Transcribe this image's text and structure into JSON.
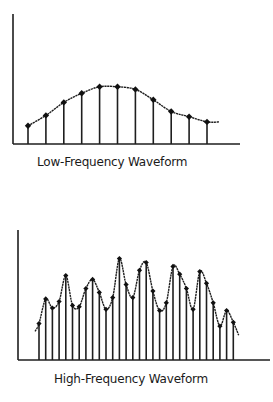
{
  "chart_data": [
    {
      "id": "low",
      "type": "line",
      "subtype": "stem-sampled-waveform",
      "title": "Low-Frequency Waveform",
      "xlabel": "",
      "ylabel": "",
      "ylim": [
        0,
        100
      ],
      "grid": false,
      "legend": "none",
      "sample_index": [
        1,
        2,
        3,
        4,
        5,
        6,
        7,
        8,
        9,
        10,
        11
      ],
      "values": [
        14,
        22,
        32,
        39,
        44,
        44,
        42,
        34,
        25,
        21,
        17
      ],
      "curve_tail_value": 17
    },
    {
      "id": "high",
      "type": "line",
      "subtype": "stem-sampled-waveform",
      "title": "High-Frequency Waveform",
      "xlabel": "",
      "ylabel": "",
      "ylim": [
        0,
        100
      ],
      "grid": false,
      "legend": "none",
      "sample_index": [
        1,
        2,
        3,
        4,
        5,
        6,
        7,
        8,
        9,
        10,
        11,
        12,
        13,
        14,
        15,
        16,
        17,
        18,
        19,
        20,
        21,
        22,
        23,
        24,
        25,
        26,
        27,
        28,
        29,
        30
      ],
      "values": [
        28,
        47,
        40,
        45,
        65,
        42,
        41,
        55,
        62,
        52,
        39,
        48,
        78,
        58,
        48,
        69,
        75,
        53,
        38,
        44,
        72,
        66,
        55,
        39,
        68,
        59,
        44,
        26,
        38,
        29
      ],
      "curve_head_value": 22,
      "curve_tail_value": 19
    }
  ],
  "colors": {
    "ink": "#1e1e1e",
    "background": "#ffffff"
  }
}
